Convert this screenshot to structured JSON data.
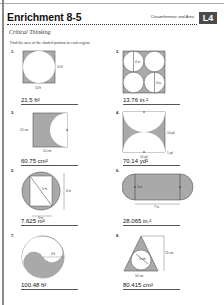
{
  "header": {
    "title": "Enrichment 8-5",
    "topic": "Circumference and Area",
    "level": "L4",
    "subtitle": "Critical Thinking"
  },
  "instructions": "Find the area of the shaded portion in each region.",
  "colors": {
    "shade": "#a9a9a9",
    "outline": "#555555",
    "level_bg": "#4a4a4a"
  },
  "problems": [
    {
      "number": "1.",
      "answer": "21.5 ft²",
      "labels": [
        "10 ft",
        "10 ft"
      ],
      "figure": "circle-in-square"
    },
    {
      "number": "2.",
      "answer": "13.76 in.²",
      "labels": [
        "4 in.",
        "4 in."
      ],
      "figure": "four-circles-in-square"
    },
    {
      "number": "3.",
      "answer": "60.75 cm²",
      "labels": [
        "10 cm",
        "10 cm"
      ],
      "figure": "square-minus-semicircle"
    },
    {
      "number": "4.",
      "answer": "70.14 yd²",
      "labels": [
        "14 yd",
        "10 yd",
        "1 yd"
      ],
      "figure": "rectangle-minus-two-semicircles"
    },
    {
      "number": "5.",
      "answer": "7.625 m²",
      "labels": [
        "5 m",
        "4 m",
        "3 m"
      ],
      "figure": "circle-minus-rectangle"
    },
    {
      "number": "6.",
      "answer": "28.065 in.²",
      "labels": [
        "3 in.",
        "7 in."
      ],
      "figure": "stadium"
    },
    {
      "number": "7.",
      "answer": "100.48 ft²",
      "labels": [
        "4 ft"
      ],
      "figure": "yin-yang"
    },
    {
      "number": "8.",
      "answer": "80.415 cm²",
      "labels": [
        "5 cm",
        "15 cm",
        "16 cm"
      ],
      "figure": "triangle-minus-circle"
    }
  ]
}
